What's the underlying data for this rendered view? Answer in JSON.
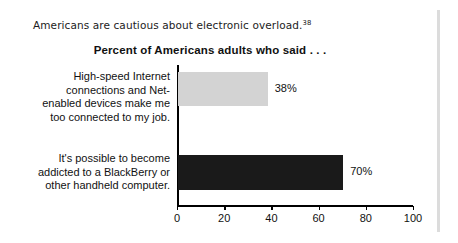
{
  "caption": {
    "text": "Americans are cautious about electronic overload.",
    "footnote_marker": "38"
  },
  "chart_data": {
    "type": "bar",
    "orientation": "horizontal",
    "title": "Percent of Americans adults who said . . .",
    "xlabel": "",
    "ylabel": "",
    "xlim": [
      0,
      100
    ],
    "xticks": [
      "0",
      "20",
      "40",
      "60",
      "80",
      "100"
    ],
    "grid": false,
    "legend": "none",
    "categories": [
      "High-speed Internet connections and Net-enabled devices make me too connected to my job.",
      "It's possible to become addicted to a BlackBerry or other handheld computer."
    ],
    "category_lines": [
      [
        "High-speed Internet",
        "connections and Net-",
        "enabled devices make me",
        "too connected to my job."
      ],
      [
        "It's possible to become",
        "addicted to a BlackBerry or",
        "other handheld computer."
      ]
    ],
    "values": [
      38,
      70
    ],
    "value_labels": [
      "38%",
      "70%"
    ],
    "bar_colors": [
      "#d3d3d3",
      "#1a1a1a"
    ]
  },
  "colors": {
    "background": "#ffffff",
    "axis": "#000000",
    "text": "#111111",
    "bar_light": "#d3d3d3",
    "bar_dark": "#1a1a1a",
    "page_rule": "#dcdcdc"
  }
}
